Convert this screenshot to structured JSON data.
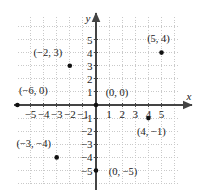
{
  "figure": {
    "type": "coordinate-plane",
    "title": "",
    "background_color": "#ffffff",
    "axis_color": "#444444",
    "grid_color": "#c9c9c9",
    "point_color": "#111111"
  },
  "axes": {
    "x_name": "x",
    "y_name": "y",
    "x_range": [
      -6.4,
      6.1
    ],
    "y_range": [
      -6.4,
      6.1
    ],
    "grid": true,
    "x_ticks": [
      {
        "value": -5,
        "label": "−5"
      },
      {
        "value": -4,
        "label": "−4"
      },
      {
        "value": -3,
        "label": "−3"
      },
      {
        "value": -2,
        "label": "−2"
      },
      {
        "value": -1,
        "label": "−1"
      },
      {
        "value": 1,
        "label": "1"
      },
      {
        "value": 2,
        "label": "2"
      },
      {
        "value": 3,
        "label": "3"
      },
      {
        "value": 4,
        "label": "4"
      },
      {
        "value": 5,
        "label": "5"
      }
    ],
    "y_ticks": [
      {
        "value": 5,
        "label": "5"
      },
      {
        "value": 4,
        "label": "4"
      },
      {
        "value": 3,
        "label": "3"
      },
      {
        "value": 2,
        "label": "2"
      },
      {
        "value": 1,
        "label": "1"
      },
      {
        "value": -1,
        "label": "−1"
      },
      {
        "value": -2,
        "label": "−2"
      },
      {
        "value": -3,
        "label": "−3"
      },
      {
        "value": -4,
        "label": "−4"
      },
      {
        "value": -5,
        "label": "−5"
      }
    ]
  },
  "chart_data": {
    "type": "scatter",
    "title": "",
    "xlabel": "x",
    "ylabel": "y",
    "xlim": [
      -6.4,
      6.1
    ],
    "ylim": [
      -6.4,
      6.1
    ],
    "grid": true,
    "legend": "none",
    "points": [
      {
        "x": -2,
        "y": 3,
        "label": "(−2, 3)",
        "label_dx": -22,
        "label_dy": -13
      },
      {
        "x": 5,
        "y": 4,
        "label": "(5, 4)",
        "label_dx": -3,
        "label_dy": -14
      },
      {
        "x": -6,
        "y": 0,
        "label": "(−6, 0)",
        "label_dx": 16,
        "label_dy": -14
      },
      {
        "x": 0,
        "y": 0,
        "label": "(0, 0)",
        "label_dx": 21,
        "label_dy": -12
      },
      {
        "x": 4,
        "y": -1,
        "label": "(4, −1)",
        "label_dx": 3,
        "label_dy": 14
      },
      {
        "x": -3,
        "y": -4,
        "label": "(−3, −4)",
        "label_dx": -23,
        "label_dy": -13
      },
      {
        "x": 0,
        "y": -5,
        "label": "(0, −5)",
        "label_dx": 27,
        "label_dy": 1
      }
    ]
  }
}
